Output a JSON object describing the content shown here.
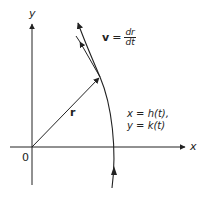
{
  "diagram": {
    "axes": {
      "x_label": "x",
      "y_label": "y",
      "origin_label": "0"
    },
    "position_vector": {
      "label": "r"
    },
    "velocity_vector": {
      "lhs": "v",
      "equals": "=",
      "numerator": "dr",
      "denominator": "dt"
    },
    "parametric": {
      "line1": "x = h(t),",
      "line2": "y = k(t)"
    },
    "colors": {
      "stroke": "#222222",
      "background": "#ffffff"
    }
  }
}
